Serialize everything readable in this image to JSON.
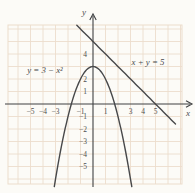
{
  "figure": {
    "background": "#fcfbf7",
    "grid_color": "#ecddcc",
    "axis_color": "#3f4042",
    "curve_color": "#47484a",
    "text_color": "#4e4e4e"
  },
  "chart_data": {
    "type": "line",
    "title": "",
    "xlabel": "x",
    "ylabel": "y",
    "xlim": [
      -6.8,
      7.2
    ],
    "ylim": [
      -6.4,
      6.3
    ],
    "grid": true,
    "legend": "none",
    "series": [
      {
        "name": "parabola",
        "equation_label": "y = 3 − x²",
        "form": "quadratic",
        "coeffs": {
          "a": -1,
          "b": 0,
          "c": 3
        },
        "vertex": [
          0,
          3
        ],
        "x_intercepts": [
          -1.732,
          1.732
        ],
        "y_intercept": 3,
        "plot_x_range": [
          -3.1,
          3.1
        ],
        "label_pos_px": [
          45,
          73
        ]
      },
      {
        "name": "line",
        "equation_label": "x + y = 5",
        "form": "linear",
        "slope": -1,
        "y_intercept": 5,
        "x_intercept": 5,
        "plot_x_range": [
          -1.3,
          6.6
        ],
        "label_pos_px": [
          148,
          64.5
        ]
      }
    ],
    "x_tick_labels": [
      [
        -5,
        "−5"
      ],
      [
        -4,
        "−4"
      ],
      [
        -3,
        "−3"
      ],
      [
        -1,
        "−1"
      ],
      [
        1,
        "1"
      ],
      [
        3,
        "3"
      ],
      [
        4,
        "4"
      ],
      [
        5,
        "5"
      ]
    ],
    "y_tick_labels": [
      [
        4,
        "4"
      ],
      [
        2,
        "2"
      ],
      [
        1,
        "1"
      ],
      [
        -1,
        "−1"
      ],
      [
        -2,
        "−2"
      ],
      [
        -3,
        "−3"
      ],
      [
        -4,
        "−4"
      ],
      [
        -5,
        "−5"
      ]
    ],
    "layout_px": {
      "origin": [
        93,
        104
      ],
      "unit": 12.5,
      "grid_rect": [
        8,
        25,
        182,
        184
      ],
      "x_axis_span": [
        5,
        192
      ],
      "y_axis_span": [
        187,
        14
      ],
      "x_label_pos": [
        188,
        116
      ],
      "y_label_pos": [
        84,
        15
      ]
    }
  }
}
